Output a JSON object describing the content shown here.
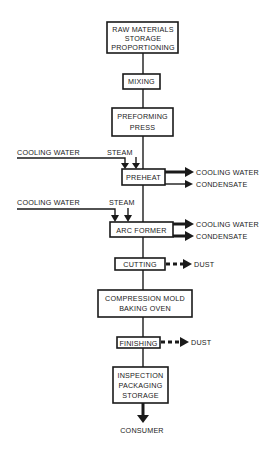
{
  "diagram": {
    "type": "process-flow",
    "background": "#ffffff",
    "stroke_color": "#1a1a1a",
    "steps": [
      {
        "id": "raw",
        "lines": [
          "RAW MATERIALS",
          "STORAGE",
          "PROPORTIONING"
        ]
      },
      {
        "id": "mixing",
        "lines": [
          "MIXING"
        ]
      },
      {
        "id": "preforming",
        "lines": [
          "PREFORMING",
          "PRESS"
        ]
      },
      {
        "id": "preheat",
        "lines": [
          "PREHEAT"
        ]
      },
      {
        "id": "arc_former",
        "lines": [
          "ARC FORMER"
        ]
      },
      {
        "id": "cutting",
        "lines": [
          "CUTTING"
        ]
      },
      {
        "id": "compression",
        "lines": [
          "COMPRESSION MOLD",
          "BAKING OVEN"
        ]
      },
      {
        "id": "finishing",
        "lines": [
          "FINISHING"
        ]
      },
      {
        "id": "inspection",
        "lines": [
          "INSPECTION",
          "PACKAGING",
          "STORAGE"
        ]
      }
    ],
    "inputs": {
      "preheat": [
        "COOLING WATER",
        "STEAM"
      ],
      "arc_former": [
        "COOLING WATER",
        "STEAM"
      ]
    },
    "outputs": {
      "preheat": [
        "COOLING WATER",
        "CONDENSATE"
      ],
      "arc_former": [
        "COOLING WATER",
        "CONDENSATE"
      ],
      "cutting": [
        "DUST"
      ],
      "finishing": [
        "DUST"
      ]
    },
    "end": "CONSUMER"
  }
}
